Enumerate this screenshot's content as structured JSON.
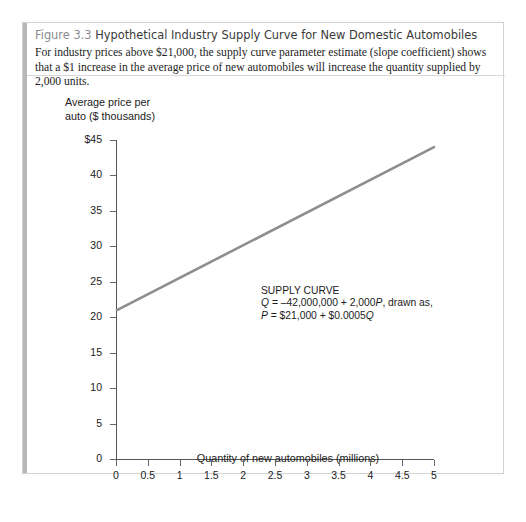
{
  "figure": {
    "number": "Figure 3.3",
    "title": "Hypothetical Industry Supply Curve for New Domestic Automobiles",
    "description": "For industry prices above $21,000, the supply curve parameter estimate (slope coefficient) shows that a $1 increase in the average price of new automobiles will increase the quantity supplied by 2,000 units."
  },
  "chart_data": {
    "type": "line",
    "title": "Hypothetical Industry Supply Curve for New Domestic Automobiles",
    "xlabel": "Quantity of new automobiles (millions)",
    "ylabel": "Average price per\nauto ($ thousands)",
    "ylabel_line1": "Average price per",
    "ylabel_line2": "auto ($ thousands)",
    "xlim": [
      0,
      5
    ],
    "ylim": [
      0,
      45
    ],
    "xticks": [
      0,
      0.5,
      1,
      1.5,
      2,
      2.5,
      3,
      3.5,
      4,
      4.5,
      5
    ],
    "xtick_labels": [
      "0",
      "0.5",
      "1",
      "1.5",
      "2",
      "2.5",
      "3",
      "3.5",
      "4",
      "4.5",
      "5"
    ],
    "yticks": [
      0,
      5,
      10,
      15,
      20,
      25,
      30,
      35,
      40,
      45
    ],
    "ytick_labels": [
      "0",
      "5",
      "10",
      "15",
      "20",
      "25",
      "30",
      "35",
      "40",
      "$45"
    ],
    "grid": false,
    "legend": false,
    "line_color": "#8e8e8e",
    "series": [
      {
        "name": "Supply curve",
        "x": [
          0,
          5
        ],
        "values": [
          21,
          44
        ]
      }
    ],
    "annotations": [
      {
        "label": "SUPPLY CURVE",
        "line2": "Q = –42,000,000 + 2,000P, drawn as,",
        "line3": "P = $21,000 + $0.0005Q",
        "x": 2.0,
        "y": 24
      }
    ]
  },
  "annotation": {
    "heading": "SUPPLY CURVE",
    "eq1_var1": "Q",
    "eq1_mid": " = –42,000,000 + 2,000",
    "eq1_var2": "P",
    "eq1_tail": ", drawn as,",
    "eq2_var1": "P",
    "eq2_mid": " = $21,000 + $0.0005",
    "eq2_var2": "Q"
  }
}
